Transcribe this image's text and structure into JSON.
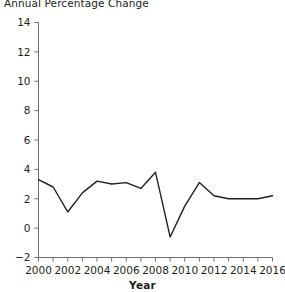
{
  "chart_data": {
    "type": "line",
    "title": "Annual Percentage Change",
    "xlabel": "Year",
    "ylabel": "",
    "x": [
      2000,
      2001,
      2002,
      2003,
      2004,
      2005,
      2006,
      2007,
      2008,
      2009,
      2010,
      2011,
      2012,
      2013,
      2014,
      2015,
      2016
    ],
    "values": [
      3.3,
      2.8,
      1.1,
      2.4,
      3.2,
      3.0,
      3.1,
      2.7,
      3.8,
      -0.6,
      1.5,
      3.1,
      2.2,
      2.0,
      2.0,
      2.0,
      2.2
    ],
    "series": [
      {
        "name": "Annual Percentage Change",
        "values": [
          3.3,
          2.8,
          1.1,
          2.4,
          3.2,
          3.0,
          3.1,
          2.7,
          3.8,
          -0.6,
          1.5,
          3.1,
          2.2,
          2.0,
          2.0,
          2.0,
          2.2
        ]
      }
    ],
    "xlim": [
      2000,
      2016
    ],
    "ylim": [
      -2,
      14
    ],
    "xticks": [
      2000,
      2002,
      2004,
      2006,
      2008,
      2010,
      2012,
      2014,
      2016
    ],
    "xtick_labels": [
      "2000",
      "2002",
      "2004",
      "2006",
      "2008",
      "2010",
      "2012",
      "2014",
      "2016"
    ],
    "xminor_ticks": [
      2001,
      2003,
      2005,
      2007,
      2009,
      2011,
      2013,
      2015
    ],
    "yticks": [
      -2,
      0,
      2,
      4,
      6,
      8,
      10,
      12,
      14
    ],
    "ytick_labels": [
      "−2",
      "0",
      "2",
      "4",
      "6",
      "8",
      "10",
      "12",
      "14"
    ],
    "grid": false,
    "legend": false,
    "line_color": "#231f20",
    "line_width": 1.4,
    "background_color": "#ffffff"
  },
  "colors": {
    "line": "#231f20",
    "axis": "#6d6e71",
    "text": "#231f20",
    "background": "#ffffff"
  }
}
